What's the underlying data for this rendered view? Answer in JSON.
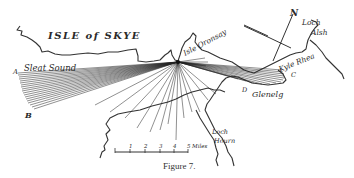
{
  "figure": {
    "caption": "Figure 7.",
    "title": "ISLE of SKYE"
  },
  "labels": {
    "isle": "ISLE of SKYE",
    "sleat_sound": "Sleat Sound",
    "isle_oronsay": "Isle Oronsay",
    "loch_alsh_1": "Loch",
    "loch_alsh_2": "Alsh",
    "kyle_rhea": "Kyle Rhea",
    "glenelg": "Glenelg",
    "loch_hourn_1": "Loch",
    "loch_hourn_2": "Hourn",
    "point_a": "A",
    "point_b": "B",
    "point_c": "C",
    "point_d": "D",
    "north": "N"
  },
  "scale_bar": {
    "ticks": [
      "1",
      "2",
      "3",
      "4",
      "5"
    ],
    "unit": "Miles"
  }
}
